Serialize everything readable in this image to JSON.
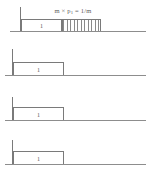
{
  "figure": {
    "caption": "",
    "formula": {
      "prefix": "m × p",
      "subscript": "1",
      "suffix": " = 1/m"
    },
    "colors": {
      "line": "#7a7a7a",
      "baseline": "#8d8d8d",
      "hatch": "#8a8a8a",
      "text": "#5a5a5a",
      "background": "#ffffff"
    },
    "rows": [
      {
        "id": "row-1",
        "box_label": "1",
        "has_hatch": true,
        "hatch_ticks": 11,
        "axis_top": 7,
        "axis_bottom": 31,
        "box_left": 21,
        "box_right": 62,
        "box_top": 19,
        "baseline_y": 31,
        "baseline_left": 10,
        "baseline_right": 146,
        "hatch_left": 62,
        "hatch_right": 101,
        "hatch_top": 19
      },
      {
        "id": "row-2",
        "box_label": "1",
        "has_hatch": false,
        "hatch_ticks": 0,
        "axis_top": 49,
        "axis_bottom": 75,
        "box_left": 13,
        "box_right": 64,
        "box_top": 62,
        "baseline_y": 75,
        "baseline_left": 5,
        "baseline_right": 146
      },
      {
        "id": "row-3",
        "box_label": "1",
        "has_hatch": false,
        "hatch_ticks": 0,
        "axis_top": 97,
        "axis_bottom": 120,
        "box_left": 13,
        "box_right": 64,
        "box_top": 107,
        "baseline_y": 120,
        "baseline_left": 5,
        "baseline_right": 146
      },
      {
        "id": "row-4",
        "box_label": "1",
        "has_hatch": false,
        "hatch_ticks": 0,
        "axis_top": 140,
        "axis_bottom": 164,
        "box_left": 13,
        "box_right": 64,
        "box_top": 151,
        "baseline_y": 164,
        "baseline_left": 5,
        "baseline_right": 146
      }
    ]
  }
}
